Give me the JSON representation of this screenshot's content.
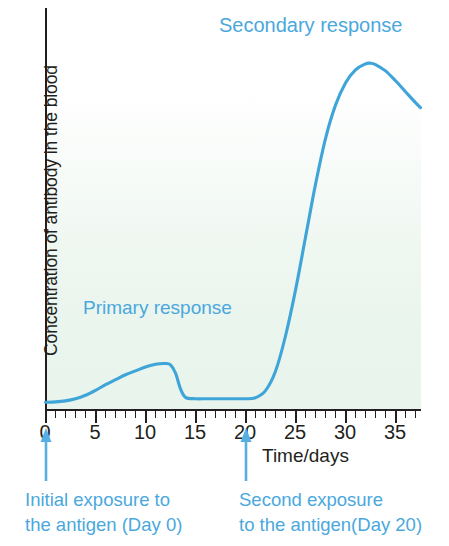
{
  "chart_data": {
    "type": "line",
    "title": "",
    "xlabel": "Time/days",
    "ylabel": "Concentration of antibody in the blood",
    "xlim": [
      0,
      37.5
    ],
    "ylim": [
      0,
      1.0
    ],
    "grid": false,
    "legend_position": "none",
    "x_ticks_major": [
      0,
      5,
      10,
      15,
      20,
      25,
      30,
      35
    ],
    "x_tick_labels": [
      "0",
      "5",
      "10",
      "15",
      "20",
      "25",
      "30",
      "35"
    ],
    "x_tick_minor_interval": 1,
    "y_ticks": [],
    "y_tick_labels": [],
    "series": [
      {
        "name": "Concentration of antibody in the blood",
        "color": "#3fa5d8",
        "x": [
          0,
          1,
          2,
          3,
          4,
          5,
          6,
          7,
          8,
          9,
          10,
          11,
          12,
          12.5,
          13,
          13.5,
          14,
          15,
          16,
          17,
          18,
          19,
          20,
          21,
          22,
          23,
          24,
          25,
          26,
          27,
          28,
          29,
          30,
          31,
          32,
          32.5,
          33,
          34,
          35,
          36,
          37,
          37.5
        ],
        "y": [
          0.012,
          0.013,
          0.016,
          0.022,
          0.032,
          0.046,
          0.062,
          0.076,
          0.09,
          0.101,
          0.112,
          0.12,
          0.122,
          0.118,
          0.095,
          0.05,
          0.026,
          0.022,
          0.022,
          0.022,
          0.022,
          0.022,
          0.022,
          0.025,
          0.045,
          0.1,
          0.2,
          0.33,
          0.48,
          0.63,
          0.76,
          0.855,
          0.918,
          0.955,
          0.972,
          0.974,
          0.97,
          0.952,
          0.924,
          0.893,
          0.862,
          0.848
        ]
      }
    ],
    "annotations": [
      {
        "text": "Secondary response",
        "x": 24.5,
        "y": 0.97,
        "color": "#4aa8dd"
      },
      {
        "text": "Primary response",
        "x": 4.0,
        "y": 0.29,
        "color": "#4aa8dd"
      },
      {
        "text": "Initial exposure to",
        "x": 0,
        "y": -0.21,
        "color": "#4aa8dd"
      },
      {
        "text": "the antigen (Day 0)",
        "x": 0,
        "y": -0.27,
        "color": "#4aa8dd"
      },
      {
        "text": "Second exposure",
        "x": 20,
        "y": -0.21,
        "color": "#4aa8dd"
      },
      {
        "text": "to the antigen(Day 20)",
        "x": 20,
        "y": -0.27,
        "color": "#4aa8dd"
      }
    ],
    "arrows": [
      {
        "name": "initial-exposure-arrow",
        "x": 0,
        "direction": "up",
        "color": "#4aa8dd"
      },
      {
        "name": "second-exposure-arrow",
        "x": 20,
        "direction": "up",
        "color": "#4aa8dd"
      }
    ]
  },
  "labels": {
    "y_axis": "Concentration of antibody in the blood",
    "x_axis": "Time/days",
    "secondary_response": "Secondary response",
    "primary_response": "Primary response",
    "initial_exposure_line1": "Initial exposure to",
    "initial_exposure_line2": "the antigen (Day 0)",
    "second_exposure_line1": "Second exposure",
    "second_exposure_line2": "to the antigen(Day 20)"
  },
  "ticks": {
    "labels": [
      "0",
      "5",
      "10",
      "15",
      "20",
      "25",
      "30",
      "35"
    ]
  },
  "colors": {
    "curve": "#3fa5d8",
    "annotation": "#4aa8dd",
    "axis": "#231f20",
    "plot_background_bottom": "#e9f4ed",
    "plot_background_top": "#ffffff"
  }
}
